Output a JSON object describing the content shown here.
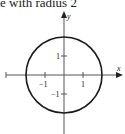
{
  "title": "e with radius 2",
  "axes": {
    "x_label": "x",
    "y_label": "y",
    "x_ticks": [
      {
        "value": -1,
        "label": "−1"
      },
      {
        "value": 1,
        "label": "1"
      }
    ],
    "y_ticks": [
      {
        "value": 1,
        "label": "1"
      },
      {
        "value": -1,
        "label": "−1"
      }
    ]
  },
  "shape": {
    "type": "circle",
    "center": [
      0,
      0
    ],
    "radius": 2
  },
  "colors": {
    "stroke": "#1a1a1a",
    "axis": "#555555"
  }
}
